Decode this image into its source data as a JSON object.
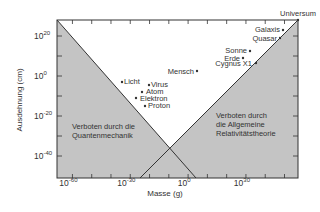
{
  "chart_data": {
    "type": "scatter",
    "title": "",
    "xlabel": "Masse (g)",
    "ylabel": "Ausdehnung (cm)",
    "xscale": "log",
    "yscale": "log",
    "xlim_exp": [
      -68,
      57
    ],
    "ylim_exp": [
      -51,
      28
    ],
    "x_ticks": [
      {
        "exp": -60,
        "label": "10",
        "sup": "-60"
      },
      {
        "exp": -30,
        "label": "10",
        "sup": "-30"
      },
      {
        "exp": 0,
        "label": "10",
        "sup": "0"
      },
      {
        "exp": 30,
        "label": "10",
        "sup": "30"
      }
    ],
    "y_ticks": [
      {
        "exp": 20,
        "label": "10",
        "sup": "20"
      },
      {
        "exp": 0,
        "label": "10",
        "sup": "0"
      },
      {
        "exp": -20,
        "label": "10",
        "sup": "-20"
      },
      {
        "exp": -40,
        "label": "10",
        "sup": "-40"
      }
    ],
    "points": [
      {
        "name": "Universum",
        "log_mass": 56,
        "log_size": 28
      },
      {
        "name": "Galaxis",
        "log_mass": 45,
        "log_size": 23
      },
      {
        "name": "Quasar",
        "log_mass": 41,
        "log_size": 19
      },
      {
        "name": "Sonne",
        "log_mass": 33,
        "log_size": 11
      },
      {
        "name": "Erde",
        "log_mass": 28,
        "log_size": 9
      },
      {
        "name": "Cygnus X1",
        "log_mass": 34,
        "log_size": 6
      },
      {
        "name": "Mensch",
        "log_mass": 5,
        "log_size": 2
      },
      {
        "name": "Licht",
        "log_mass": -40,
        "log_size": -12
      },
      {
        "name": "Virus",
        "log_mass": -28,
        "log_size": -14
      },
      {
        "name": "Atom",
        "log_mass": -30,
        "log_size": -19
      },
      {
        "name": "Elektron",
        "log_mass": -34,
        "log_size": -23
      },
      {
        "name": "Proton",
        "log_mass": -27,
        "log_size": -27
      }
    ],
    "regions": [
      {
        "name": "quantum",
        "label_lines": [
          "Verboten durch die",
          "Quantenmechanik"
        ],
        "fill": "#c8c8c8"
      },
      {
        "name": "relativity",
        "label_lines": [
          "Verboten durch",
          "die Allgemeine",
          "Relativitätstheorie"
        ],
        "fill": "#c8c8c8"
      }
    ],
    "grid": false,
    "legend": "none"
  },
  "colors": {
    "forbidden_fill": "#c4c4c4",
    "line": "#333333",
    "background": "#ffffff"
  }
}
